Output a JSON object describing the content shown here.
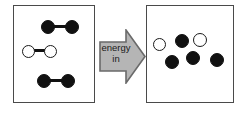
{
  "diagram": {
    "title": "energy in",
    "arrow": {
      "line1": "energy",
      "line2": "in",
      "direction": "right",
      "fill_color": "#b5b5b5",
      "stroke_color": "#6a6a6a",
      "text_color": "#1b1b1b"
    },
    "colors": {
      "panel_border": "#4a4a4a",
      "background": "#ffffff",
      "dark_atom": "#111111",
      "light_atom_fill": "#ffffff",
      "light_atom_stroke": "#1a1a1a",
      "bond": "#111111"
    },
    "left_panel": {
      "name": "reactants-before-energy",
      "state": "bonded molecules",
      "molecules": [
        {
          "id": "molecule-top-dark",
          "atoms": [
            {
              "fill": "dark",
              "x": 27,
              "y": 14,
              "d": 14
            },
            {
              "fill": "dark",
              "x": 51,
              "y": 14,
              "d": 14
            }
          ],
          "bond": {
            "x": 38,
            "y": 20,
            "w": 14
          }
        },
        {
          "id": "molecule-middle-light",
          "atoms": [
            {
              "fill": "light",
              "x": 8,
              "y": 39,
              "d": 13
            },
            {
              "fill": "light",
              "x": 30,
              "y": 39,
              "d": 13
            }
          ],
          "bond": {
            "x": 19,
            "y": 44,
            "w": 13
          }
        },
        {
          "id": "molecule-bottom-dark",
          "atoms": [
            {
              "fill": "dark",
              "x": 23,
              "y": 68,
              "d": 14
            },
            {
              "fill": "dark",
              "x": 47,
              "y": 68,
              "d": 14
            }
          ],
          "bond": {
            "x": 34,
            "y": 74,
            "w": 14
          }
        }
      ]
    },
    "right_panel": {
      "name": "products-after-energy",
      "state": "separated free atoms",
      "atoms": [
        {
          "id": "atom-light-1",
          "fill": "light",
          "x": 6,
          "y": 32,
          "d": 13
        },
        {
          "id": "atom-dark-1",
          "fill": "dark",
          "x": 28,
          "y": 28,
          "d": 14
        },
        {
          "id": "atom-light-2",
          "fill": "light",
          "x": 46,
          "y": 27,
          "d": 14
        },
        {
          "id": "atom-dark-2",
          "fill": "dark",
          "x": 18,
          "y": 49,
          "d": 14
        },
        {
          "id": "atom-dark-3",
          "fill": "dark",
          "x": 39,
          "y": 45,
          "d": 14
        },
        {
          "id": "atom-dark-4",
          "fill": "dark",
          "x": 63,
          "y": 47,
          "d": 14
        }
      ]
    }
  }
}
